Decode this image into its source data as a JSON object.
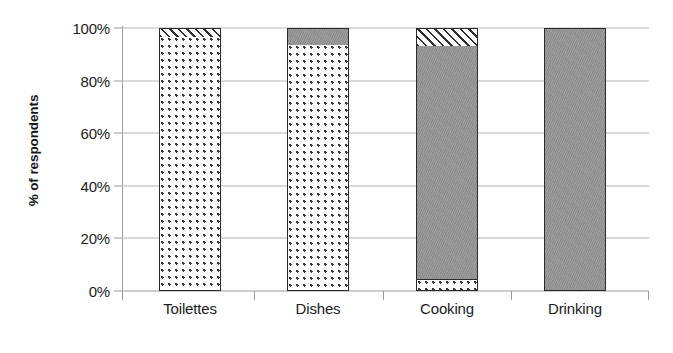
{
  "chart_data": {
    "type": "bar",
    "subtype": "stacked-100-percent",
    "title": "",
    "subtitle": "",
    "xlabel": "",
    "ylabel": "% of respondents",
    "categories": [
      "Toilettes",
      "Dishes",
      "Cooking",
      "Drinking"
    ],
    "ylim": [
      0,
      100
    ],
    "y_ticks": [
      0,
      20,
      40,
      60,
      80,
      100
    ],
    "y_tick_labels": [
      "0%",
      "20%",
      "40%",
      "60%",
      "80%",
      "100%"
    ],
    "grid": true,
    "grid_axis": "y",
    "legend": false,
    "legend_position": "none",
    "annotations": [],
    "series": [
      {
        "name": "dotted",
        "pattern": "dotted",
        "color": "#ffffff",
        "pattern_color": "#3a3a3a",
        "values": [
          96.5,
          93.5,
          4.0,
          0.0
        ]
      },
      {
        "name": "gray",
        "pattern": "solid",
        "color": "#949494",
        "pattern_color": "#949494",
        "values": [
          0.0,
          6.5,
          89.0,
          100.0
        ]
      },
      {
        "name": "hatched",
        "pattern": "diagonal-hatch",
        "color": "#ffffff",
        "pattern_color": "#2f2f2f",
        "values": [
          3.5,
          0.0,
          7.0,
          0.0
        ]
      }
    ]
  },
  "style": {
    "background": "#ffffff",
    "grid_color": "#b4b4b4",
    "axis_color": "#9a9a9a",
    "bar_outline": "#2b2b2b",
    "text_color": "#1c1c1c",
    "gray_fill": "#949494"
  },
  "geometry": {
    "bar_width": 62,
    "bar_centers": [
      68,
      196,
      325,
      453
    ]
  }
}
